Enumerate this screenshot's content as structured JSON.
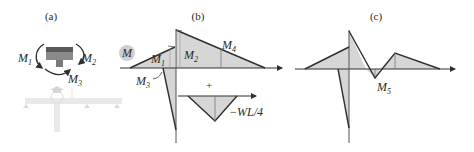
{
  "panels": {
    "a": {
      "label": "(a)",
      "moments": {
        "m1": "M",
        "m1_sub": "1",
        "m2": "M",
        "m2_sub": "2",
        "m3": "M",
        "m3_sub": "3"
      }
    },
    "b": {
      "label": "(b)",
      "badge": "M",
      "labels": {
        "m1": "M",
        "m1_sub": "1",
        "m2": "M",
        "m2_sub": "2",
        "m3": "M",
        "m3_sub": "3",
        "m4": "M",
        "m4_sub": "4",
        "plus": "+",
        "wl4": "−WL/4"
      }
    },
    "c": {
      "label": "(c)",
      "labels": {
        "m5": "M",
        "m5_sub": "5"
      }
    }
  },
  "colors": {
    "fill": "#d6d6d6",
    "line": "#2f2f2f",
    "faded": "#c8c8c8",
    "badge": "#cfcfcf",
    "block": "#7a7a7a"
  }
}
